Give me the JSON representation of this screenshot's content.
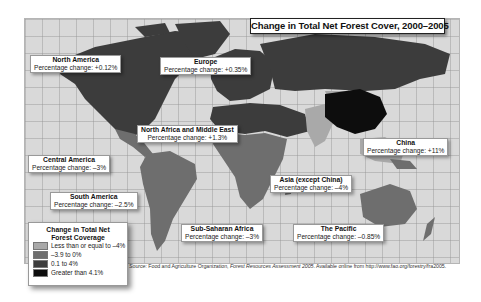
{
  "title": "Change in Total Net Forest Cover, 2000–2005",
  "regions": [
    {
      "name": "North America",
      "change_label": "Percentage change: +0.12%",
      "change": 0.12,
      "category": "0.1 to 4%"
    },
    {
      "name": "Europe",
      "change_label": "Percentage change: +0.35%",
      "change": 0.35,
      "category": "0.1 to 4%"
    },
    {
      "name": "North Africa and Middle East",
      "change_label": "Percentage change: +1.3%",
      "change": 1.3,
      "category": "0.1 to 4%"
    },
    {
      "name": "China",
      "change_label": "Percentage change: +11%",
      "change": 11,
      "category": "Greater than 4.1%"
    },
    {
      "name": "Central America",
      "change_label": "Percentage change: –3%",
      "change": -3,
      "category": "–3.9 to 0%"
    },
    {
      "name": "South America",
      "change_label": "Percentage change: –2.5%",
      "change": -2.5,
      "category": "–3.9 to 0%"
    },
    {
      "name": "Asia (except China)",
      "change_label": "Percentage change: –4%",
      "change": -4,
      "category": "Less than or equal to –4%"
    },
    {
      "name": "Sub-Saharan Africa",
      "change_label": "Percentage change: –3%",
      "change": -3,
      "category": "–3.9 to 0%"
    },
    {
      "name": "The Pacific",
      "change_label": "Percentage change: –0.85%",
      "change": -0.85,
      "category": "–3.9 to 0%"
    }
  ],
  "legend": {
    "title_line1": "Change in Total Net",
    "title_line2": "Forest Coverage",
    "items": [
      {
        "label": "Less than or equal to –4%",
        "color": "#a9a9a9"
      },
      {
        "label": "–3.9 to 0%",
        "color": "#6e6e6e"
      },
      {
        "label": "0.1 to 4%",
        "color": "#3c3c3c"
      },
      {
        "label": "Greater than 4.1%",
        "color": "#0d0d0d"
      }
    ]
  },
  "source": {
    "prefix": "Source:",
    "org": " Food and Agriculture Organization, ",
    "work": "Forest Resources Assessment 2005",
    "suffix": ". Available online from http://www.fao.org/forestry/fra2005."
  },
  "colors": {
    "ocean": "#d9d9d9",
    "grid": "#969696",
    "light": "#a9a9a9",
    "medium": "#6e6e6e",
    "dark": "#3c3c3c",
    "black": "#0d0d0d"
  }
}
